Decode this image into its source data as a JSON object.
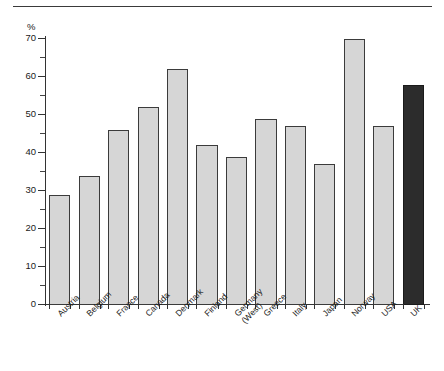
{
  "chart_data": {
    "type": "bar",
    "title": "",
    "subtitle": "",
    "xlabel": "",
    "ylabel": "%",
    "ylim": [
      0,
      70
    ],
    "grid": false,
    "legend": null,
    "y_major_ticks": [
      0,
      10,
      20,
      30,
      40,
      50,
      60,
      70
    ],
    "y_minor_ticks": [
      5,
      15,
      25,
      35,
      45,
      55,
      65
    ],
    "y_tick_labels": [
      "0",
      "10",
      "20",
      "30",
      "40",
      "50",
      "60",
      "70"
    ],
    "categories": [
      "Austria",
      "Belgium",
      "France",
      "Canada",
      "Denmark",
      "Finland",
      "Germany (West)",
      "Greece",
      "Italy",
      "Japan",
      "Norway",
      "USA",
      "UK"
    ],
    "category_lines": [
      [
        "Austria"
      ],
      [
        "Belgium"
      ],
      [
        "France"
      ],
      [
        "Canada"
      ],
      [
        "Denmark"
      ],
      [
        "Finland"
      ],
      [
        "Germany",
        "(West)"
      ],
      [
        "Greece"
      ],
      [
        "Italy"
      ],
      [
        "Japan"
      ],
      [
        "Norway"
      ],
      [
        "USA"
      ],
      [
        "UK"
      ]
    ],
    "values": [
      29,
      34,
      46,
      52,
      62,
      42,
      39,
      49,
      47,
      37,
      70,
      47,
      58
    ],
    "highlight_index": 12,
    "colors": {
      "bar_fill": "#d6d6d6",
      "bar_edge": "#3b3b3b",
      "highlight_fill": "#2c2c2c",
      "highlight_edge": "#1a1a1a",
      "axis": "#333333",
      "text": "#1a1a1a",
      "background": "#ffffff",
      "top_rule": "#3a3a3a"
    }
  }
}
